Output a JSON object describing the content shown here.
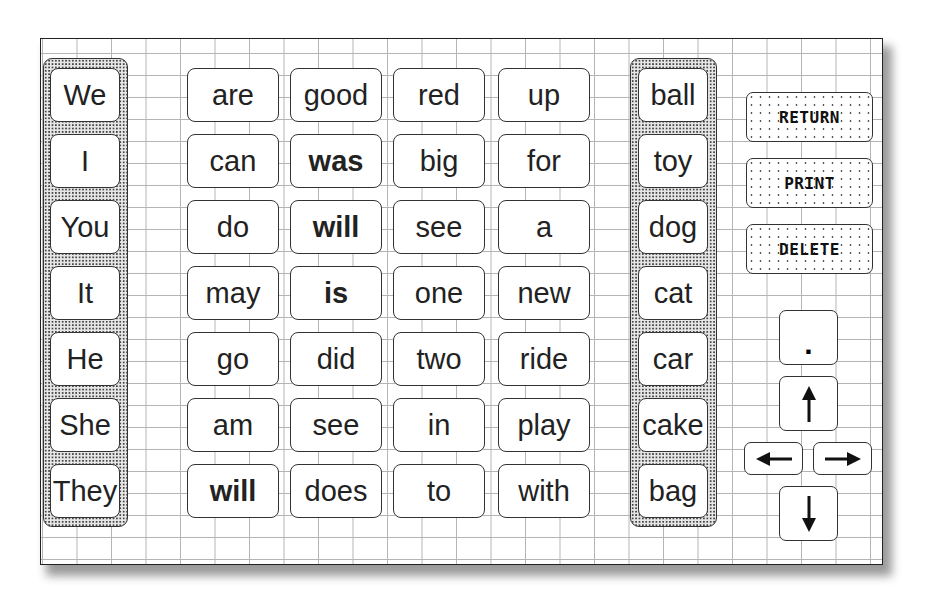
{
  "pronouns": [
    "We",
    "I",
    "You",
    "It",
    "He",
    "She",
    "They"
  ],
  "middle_columns": [
    [
      "are",
      "can",
      "do",
      "may",
      "go",
      "am",
      "will"
    ],
    [
      "good",
      "was",
      "will",
      "is",
      "did",
      "see",
      "does"
    ],
    [
      "red",
      "big",
      "see",
      "one",
      "two",
      "in",
      "to"
    ],
    [
      "up",
      "for",
      "a",
      "new",
      "ride",
      "play",
      "with"
    ]
  ],
  "nouns": [
    "ball",
    "toy",
    "dog",
    "cat",
    "car",
    "cake",
    "bag"
  ],
  "commands": {
    "return_label": "RETURN",
    "print_label": "PRINT",
    "delete_label": "DELETE"
  },
  "keys": {
    "period_label": ".",
    "up_icon": "arrow-up",
    "left_icon": "arrow-left",
    "right_icon": "arrow-right",
    "down_icon": "arrow-down"
  }
}
